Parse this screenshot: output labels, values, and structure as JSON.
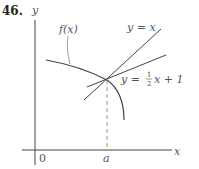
{
  "problem": {
    "number": "46."
  },
  "diagram": {
    "axes": {
      "y_label": "y",
      "x_label": "x",
      "origin_label": "0",
      "point_label": "a"
    },
    "curve": {
      "label": "f(x)"
    },
    "lines": [
      {
        "name": "line-y-equals-x",
        "label": "y = x"
      },
      {
        "name": "line-y-half-x-plus-1",
        "label_prefix": "y = ",
        "frac_num": "1",
        "frac_den": "2",
        "label_suffix": "x + 1"
      }
    ],
    "colors": {
      "stroke": "#333333",
      "text": "#555555"
    }
  }
}
